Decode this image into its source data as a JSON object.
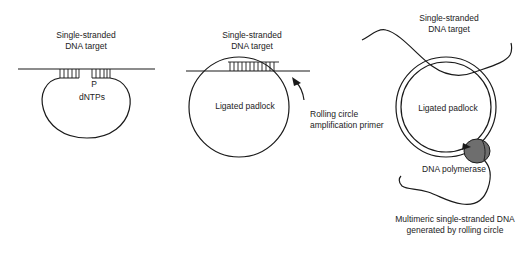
{
  "panels": [
    {
      "id": "panel-1",
      "labels": {
        "target": [
          "Single-stranded",
          "DNA target"
        ],
        "phosphate": "P",
        "dntps": "dNTPs"
      }
    },
    {
      "id": "panel-2",
      "labels": {
        "target": [
          "Single-stranded",
          "DNA target"
        ],
        "padlock": "Ligated padlock",
        "primer": [
          "Rolling circle",
          "amplification primer"
        ]
      }
    },
    {
      "id": "panel-3",
      "labels": {
        "target": [
          "Single-stranded",
          "DNA target"
        ],
        "padlock": "Ligated padlock",
        "polymerase": "DNA polymerase",
        "product": [
          "Multimeric single-stranded DNA",
          "generated by rolling circle"
        ]
      }
    }
  ],
  "colors": {
    "line": "#1a1a1a",
    "polymerase_fill": "#6e6e6e",
    "background": "#ffffff"
  }
}
